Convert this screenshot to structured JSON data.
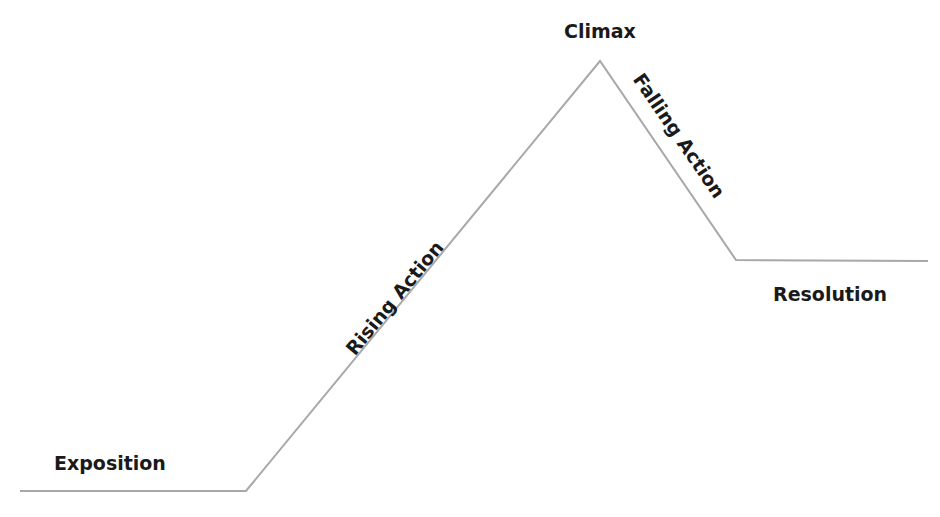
{
  "diagram": {
    "type": "plot-structure-freytag-pyramid",
    "line_color": "#a8a8a8",
    "text_color": "#1a1a1a",
    "points": [
      [
        20,
        491
      ],
      [
        246,
        491
      ],
      [
        600,
        61
      ],
      [
        736,
        260
      ],
      [
        928,
        261
      ]
    ],
    "labels": {
      "exposition": "Exposition",
      "rising_action": "Rising Action",
      "climax": "Climax",
      "falling_action": "Falling Action",
      "resolution": "Resolution"
    }
  }
}
